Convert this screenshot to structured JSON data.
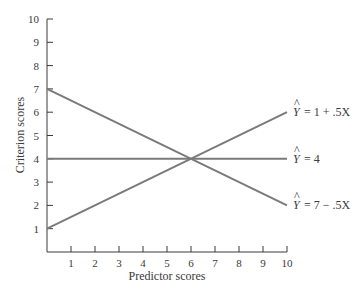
{
  "chart_data": {
    "type": "line",
    "title": "",
    "xlabel": "Predictor scores",
    "ylabel": "Criterion scores",
    "xlim": [
      0,
      10
    ],
    "ylim": [
      0,
      10
    ],
    "x_ticks": [
      "1",
      "2",
      "3",
      "4",
      "5",
      "6",
      "7",
      "8",
      "9",
      "10"
    ],
    "y_ticks": [
      "1",
      "2",
      "3",
      "4",
      "5",
      "6",
      "7",
      "8",
      "9",
      "10"
    ],
    "grid": false,
    "legend": "inline labels at right end of lines",
    "series": [
      {
        "name": "Ŷ = 1 + .5X",
        "x": [
          0,
          10
        ],
        "y": [
          1,
          6
        ],
        "color": "#7a7a7a"
      },
      {
        "name": "Ŷ = 4",
        "x": [
          0,
          10
        ],
        "y": [
          4,
          4
        ],
        "color": "#7a7a7a"
      },
      {
        "name": "Ŷ = 7 − .5X",
        "x": [
          0,
          10
        ],
        "y": [
          7,
          2
        ],
        "color": "#7a7a7a"
      }
    ],
    "annotations": [
      "Lines intersect at (6, 4)"
    ]
  },
  "labels": {
    "xlabel": "Predictor scores",
    "ylabel": "Criterion scores",
    "eq1_rhs": "= 1 + .5X",
    "eq2_rhs": "= 4",
    "eq3_rhs": "= 7 − .5X",
    "yhat": "Y",
    "hat": "^"
  },
  "colors": {
    "line": "#7a7a7a",
    "axis": "#3a3a3a"
  }
}
